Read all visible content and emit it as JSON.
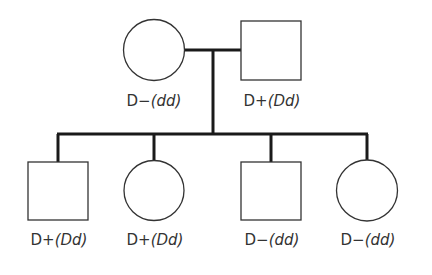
{
  "colors": {
    "line": "#1a1a1a",
    "shape_stroke": "#333333",
    "text": "#333333"
  },
  "parents": [
    {
      "id": "mother",
      "sex": "female",
      "shape": "circle",
      "phenotype": "D−",
      "genotype": "(dd)"
    },
    {
      "id": "father",
      "sex": "male",
      "shape": "square",
      "phenotype": "D+",
      "genotype": "(Dd)"
    }
  ],
  "children": [
    {
      "id": "child1",
      "sex": "male",
      "shape": "square",
      "phenotype": "D+",
      "genotype": "(Dd)"
    },
    {
      "id": "child2",
      "sex": "female",
      "shape": "circle",
      "phenotype": "D+",
      "genotype": "(Dd)"
    },
    {
      "id": "child3",
      "sex": "male",
      "shape": "square",
      "phenotype": "D−",
      "genotype": "(dd)"
    },
    {
      "id": "child4",
      "sex": "female",
      "shape": "circle",
      "phenotype": "D−",
      "genotype": "(dd)"
    }
  ]
}
